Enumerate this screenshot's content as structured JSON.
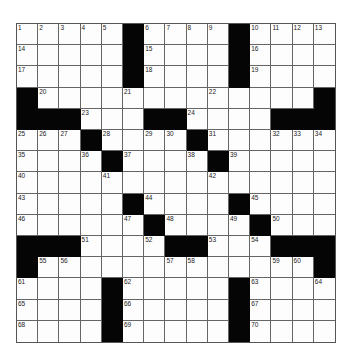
{
  "puzzle": {
    "size": 15,
    "rows": [
      [
        "1",
        "2",
        "3",
        "4",
        "5",
        "#",
        "6",
        "7",
        "8",
        "9",
        "#",
        "10",
        "11",
        "12",
        "13"
      ],
      [
        "14",
        "",
        "",
        "",
        "",
        "#",
        "15",
        "",
        "",
        "",
        "#",
        "16",
        "",
        "",
        ""
      ],
      [
        "17",
        "",
        "",
        "",
        "",
        "#",
        "18",
        "",
        "",
        "",
        "#",
        "19",
        "",
        "",
        ""
      ],
      [
        "#",
        "20",
        "",
        "",
        "",
        "21",
        "",
        "",
        "",
        "22",
        "",
        "",
        "",
        "",
        "#"
      ],
      [
        "#",
        "#",
        "#",
        "23",
        "",
        "",
        "#",
        "#",
        "24",
        "",
        "",
        "",
        "#",
        "#",
        "#"
      ],
      [
        "25",
        "26",
        "27",
        "#",
        "28",
        "",
        "29",
        "30",
        "#",
        "31",
        "",
        "",
        "32",
        "33",
        "34"
      ],
      [
        "35",
        "",
        "",
        "36",
        "#",
        "37",
        "",
        "",
        "38",
        "#",
        "39",
        "",
        "",
        "",
        ""
      ],
      [
        "40",
        "",
        "",
        "",
        "41",
        "",
        "",
        "",
        "",
        "42",
        "",
        "",
        "",
        "",
        ""
      ],
      [
        "43",
        "",
        "",
        "",
        "",
        "#",
        "44",
        "",
        "",
        "",
        "#",
        "45",
        "",
        "",
        ""
      ],
      [
        "46",
        "",
        "",
        "",
        "",
        "47",
        "#",
        "48",
        "",
        "",
        "49",
        "#",
        "50",
        "",
        ""
      ],
      [
        "#",
        "#",
        "#",
        "51",
        "",
        "",
        "52",
        "#",
        "#",
        "53",
        "",
        "54",
        "#",
        "#",
        "#"
      ],
      [
        "#",
        "55",
        "56",
        "",
        "",
        "",
        "",
        "57",
        "58",
        "",
        "",
        "",
        "59",
        "60",
        "#"
      ],
      [
        "61",
        "",
        "",
        "",
        "#",
        "62",
        "",
        "",
        "",
        "",
        "#",
        "63",
        "",
        "",
        "64"
      ],
      [
        "65",
        "",
        "",
        "",
        "#",
        "66",
        "",
        "",
        "",
        "",
        "#",
        "67",
        "",
        "",
        ""
      ],
      [
        "68",
        "",
        "",
        "",
        "#",
        "69",
        "",
        "",
        "",
        "",
        "#",
        "70",
        "",
        "",
        ""
      ]
    ],
    "colors": {
      "black_cell": "#050505",
      "white_cell": "#fdfdfd",
      "grid_line": "#666666"
    }
  }
}
